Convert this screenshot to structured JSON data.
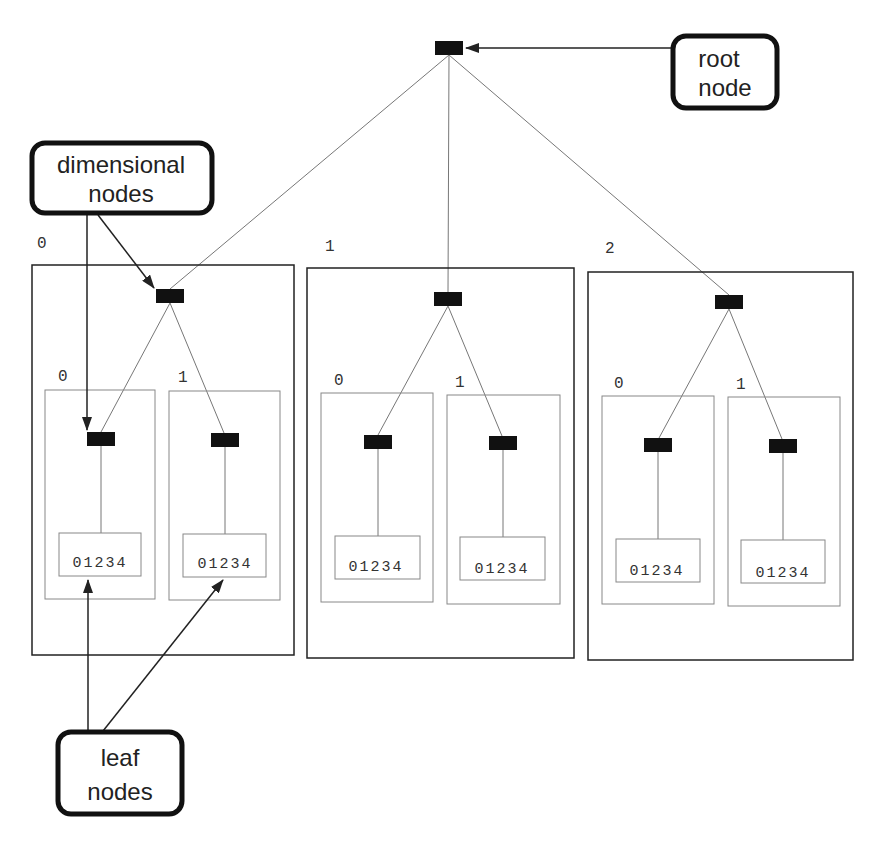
{
  "diagram": {
    "type": "tree",
    "colors": {
      "node": "#111111",
      "frame": "#222222",
      "inner_frame": "#888888",
      "edge": "#777777",
      "arrow": "#222222",
      "background": "#ffffff"
    },
    "callouts": {
      "root": {
        "line1": "root",
        "line2": "node"
      },
      "dimensional": {
        "line1": "dimensional",
        "line2": "nodes"
      },
      "leaf": {
        "line1": "leaf",
        "line2": "nodes"
      }
    },
    "groups": [
      {
        "label": "0",
        "children": [
          {
            "label": "0",
            "leaf": "01234"
          },
          {
            "label": "1",
            "leaf": "01234"
          }
        ]
      },
      {
        "label": "1",
        "children": [
          {
            "label": "0",
            "leaf": "01234"
          },
          {
            "label": "1",
            "leaf": "01234"
          }
        ]
      },
      {
        "label": "2",
        "children": [
          {
            "label": "0",
            "leaf": "01234"
          },
          {
            "label": "1",
            "leaf": "01234"
          }
        ]
      }
    ]
  }
}
